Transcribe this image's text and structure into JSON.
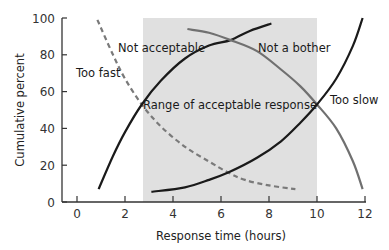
{
  "chart_data": {
    "type": "line",
    "title": "",
    "xlabel": "Response time (hours)",
    "ylabel": "Cumulative percent",
    "xlim": [
      -0.6,
      12.2
    ],
    "ylim": [
      0,
      100
    ],
    "x_ticks": [
      0,
      2,
      4,
      6,
      8,
      10,
      12
    ],
    "y_ticks": [
      0,
      20,
      40,
      60,
      80,
      100
    ],
    "grid": false,
    "legend": "none (inline annotations)",
    "shaded_region": {
      "label": "Range of acceptable response",
      "x_start": 2.75,
      "x_end": 10,
      "color": "#e0e0e0"
    },
    "series": [
      {
        "name": "Too fast",
        "style": "dashed",
        "color": "#7a7a7a",
        "x": [
          0.85,
          1.5,
          2.0,
          2.7,
          3.5,
          4.5,
          5.5,
          6.3,
          7.0,
          8.0,
          9.1
        ],
        "values": [
          99,
          80,
          67,
          53,
          41,
          30,
          22,
          16,
          12,
          9,
          7
        ]
      },
      {
        "name": "Not acceptable",
        "style": "solid",
        "color": "#1a1a1a",
        "x": [
          0.9,
          1.5,
          2.0,
          2.7,
          3.5,
          4.5,
          5.5,
          6.4,
          7.2,
          8.1
        ],
        "values": [
          7,
          25,
          38,
          53,
          66,
          78,
          85,
          88,
          93,
          97
        ]
      },
      {
        "name": "Not a bother",
        "style": "solid",
        "color": "#707070",
        "x": [
          4.6,
          5.5,
          6.4,
          7.5,
          8.5,
          9.3,
          10.0,
          10.8,
          11.5,
          11.9
        ],
        "values": [
          94,
          92,
          88,
          82,
          72,
          63,
          53,
          40,
          22,
          7
        ]
      },
      {
        "name": "Too slow",
        "style": "solid",
        "color": "#1a1a1a",
        "x": [
          3.1,
          4.5,
          5.5,
          6.3,
          7.5,
          8.5,
          9.3,
          10.0,
          10.8,
          11.5,
          11.9
        ],
        "values": [
          5.5,
          8,
          12,
          16,
          24,
          33,
          43,
          53,
          67,
          85,
          100
        ]
      }
    ],
    "annotations": [
      {
        "text": "Too fast",
        "x": 0.1,
        "y": 81
      },
      {
        "text": "Not acceptable",
        "x": 3.5,
        "y": 91
      },
      {
        "text": "Not a bother",
        "x": 7.6,
        "y": 91
      },
      {
        "text": "Range of acceptable response",
        "x": 6.3,
        "y": 56
      },
      {
        "text": "Too slow",
        "x": 11.0,
        "y": 58
      }
    ]
  },
  "axes": {
    "x_title": "Response time (hours)",
    "y_title": "Cumulative percent",
    "x_tick_labels": [
      "0",
      "2",
      "4",
      "6",
      "8",
      "10",
      "12"
    ],
    "y_tick_labels": [
      "0",
      "20",
      "40",
      "60",
      "80",
      "100"
    ]
  },
  "labels": {
    "too_fast": "Too fast",
    "not_acceptable": "Not acceptable",
    "not_a_bother": "Not a bother",
    "range": "Range of acceptable response",
    "too_slow": "Too slow"
  }
}
